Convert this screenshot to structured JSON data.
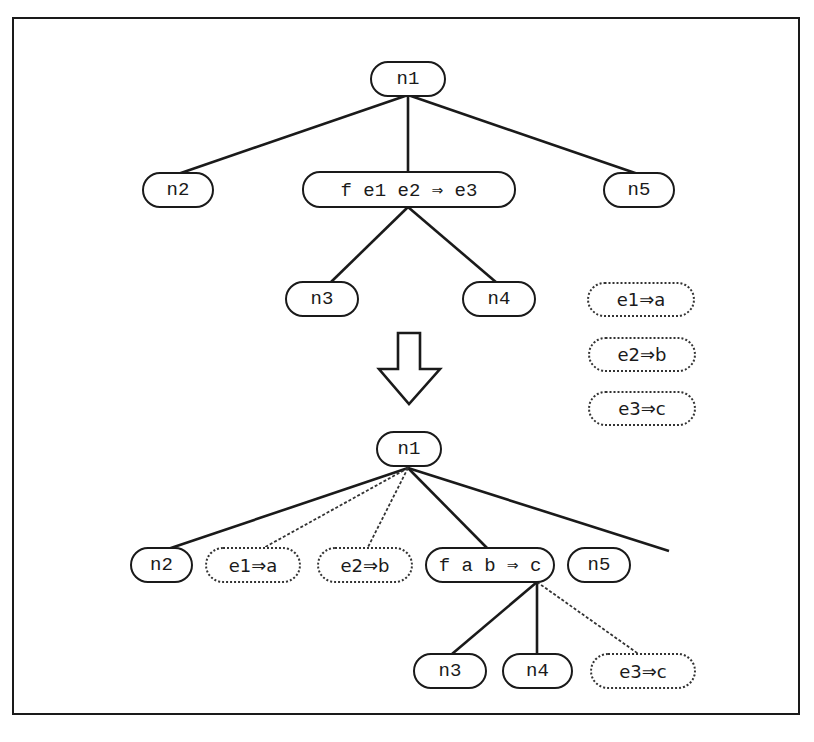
{
  "diagram": {
    "top_tree": {
      "root": "n1",
      "left": "n2",
      "middle": "f e1 e2 ⇒ e3",
      "right": "n5",
      "middle_children": [
        "n3",
        "n4"
      ]
    },
    "substitutions": [
      "e1⇒a",
      "e2⇒b",
      "e3⇒c"
    ],
    "transform_arrow": "down-arrow",
    "bottom_tree": {
      "root": "n1",
      "children": [
        "n2",
        "e1⇒a",
        "e2⇒b",
        "f a b ⇒ c",
        "n5"
      ],
      "sub_children": [
        "n3",
        "n4",
        "e3⇒c"
      ]
    }
  }
}
